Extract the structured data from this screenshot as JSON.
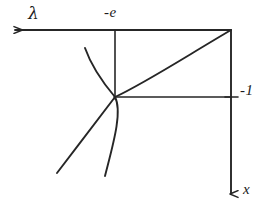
{
  "figure": {
    "kind": "hand-drawn-axis-diagram",
    "width": 268,
    "height": 212,
    "background_color": "#ffffff",
    "ink_color": "#262626"
  },
  "axes": {
    "horizontal": {
      "name": "lambda-axis",
      "label": "λ",
      "arrow_direction": "left",
      "arrow_tip": [
        12,
        30
      ],
      "line_start": [
        12,
        30
      ],
      "line_end": [
        231,
        30
      ]
    },
    "vertical": {
      "name": "x-axis",
      "label": "x",
      "arrow_direction": "down",
      "arrow_tip": [
        231,
        199
      ],
      "line_start": [
        231,
        30
      ],
      "line_end": [
        231,
        199
      ]
    }
  },
  "ticks": [
    {
      "name": "tick-minus-e",
      "label": "-e",
      "axis": "lambda",
      "position": [
        115,
        30
      ],
      "orientation": "vertical",
      "label_offset": [
        -11,
        -16
      ]
    },
    {
      "name": "tick-minus-one",
      "label": "-1",
      "axis": "x",
      "position": [
        231,
        97
      ],
      "orientation": "horizontal",
      "label_offset": [
        9,
        -14
      ]
    }
  ],
  "origin": {
    "name": "curve-intersection-point",
    "position": [
      115,
      97
    ]
  },
  "guide_lines": [
    {
      "name": "vertical-guide-from-minus-e",
      "from": [
        115,
        30
      ],
      "to": [
        115,
        97
      ]
    },
    {
      "name": "horizontal-guide-to-minus-one",
      "from": [
        115,
        97
      ],
      "to": [
        231,
        97
      ]
    }
  ],
  "curves": [
    {
      "name": "rising-curve",
      "description": "concave-down curve from origin rising to top-right corner",
      "path": "M 115 97 C 145 83, 185 57, 231 30"
    },
    {
      "name": "arc-upper-left-branch",
      "description": "arc descending from upper left through origin continuing down-right",
      "path": "M 85 48 C 92 68, 104 84, 115 97 C 123 112, 112 148, 105 176"
    },
    {
      "name": "arc-lower-left-branch",
      "description": "branch leaving origin sweeping down to the lower left",
      "path": "M 115 97 C 100 117, 76 148, 57 173"
    }
  ],
  "labels": {
    "lambda": "λ",
    "minus_e": "-e",
    "minus_one": "-1",
    "x": "x"
  }
}
